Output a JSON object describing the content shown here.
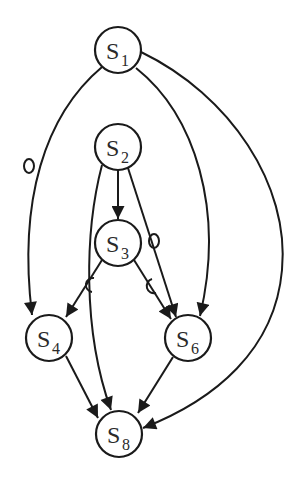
{
  "diagram": {
    "type": "directed-graph",
    "colors": {
      "stroke": "#1a1a1a",
      "fill": "#ffffff",
      "text": "#2a2a2a"
    },
    "nodes": [
      {
        "id": "S1",
        "letter": "S",
        "subscript": "1"
      },
      {
        "id": "S2",
        "letter": "S",
        "subscript": "2"
      },
      {
        "id": "S3",
        "letter": "S",
        "subscript": "3"
      },
      {
        "id": "S4",
        "letter": "S",
        "subscript": "4"
      },
      {
        "id": "S6",
        "letter": "S",
        "subscript": "6"
      },
      {
        "id": "S8",
        "letter": "S",
        "subscript": "8"
      }
    ],
    "edges": [
      {
        "from": "S1",
        "to": "S4",
        "marker": "slashed-circle"
      },
      {
        "from": "S1",
        "to": "S6",
        "marker": "none"
      },
      {
        "from": "S1",
        "to": "S8",
        "marker": "none"
      },
      {
        "from": "S2",
        "to": "S3",
        "marker": "none"
      },
      {
        "from": "S2",
        "to": "S6",
        "marker": "slashed-circle"
      },
      {
        "from": "S2",
        "to": "S8",
        "marker": "none"
      },
      {
        "from": "S3",
        "to": "S4",
        "marker": "crossed-c"
      },
      {
        "from": "S3",
        "to": "S6",
        "marker": "crossed-c"
      },
      {
        "from": "S4",
        "to": "S8",
        "marker": "none"
      },
      {
        "from": "S6",
        "to": "S8",
        "marker": "none"
      }
    ]
  }
}
